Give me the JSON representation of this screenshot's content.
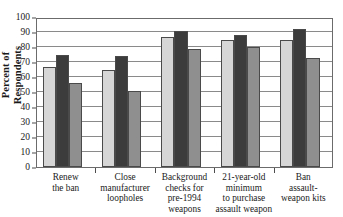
{
  "chart_data": {
    "type": "bar",
    "title": "",
    "xlabel": "",
    "ylabel": "Percent of Respondents",
    "ylabel_lines": [
      "Percent of",
      "Respondents"
    ],
    "ylim": [
      0,
      100
    ],
    "ytick_values": [
      0,
      10,
      20,
      30,
      40,
      50,
      60,
      70,
      80,
      90,
      100
    ],
    "ytick_labels": [
      "0",
      "10",
      "20",
      "30",
      "40",
      "50",
      "60",
      "70",
      "80",
      "90",
      "100"
    ],
    "grid": true,
    "legend": "none",
    "categories": [
      "Renew the ban",
      "Close manufacturer loopholes",
      "Background checks for pre-1994 weapons",
      "21-year-old minimum to purchase assault weapon",
      "Ban assault-weapon kits"
    ],
    "category_lines": [
      [
        "Renew",
        "the ban"
      ],
      [
        "Close",
        "manufacturer",
        "loopholes"
      ],
      [
        "Background",
        "checks for",
        "pre-1994",
        "weapons"
      ],
      [
        "21-year-old",
        "minimum",
        "to purchase",
        "assault weapon"
      ],
      [
        "Ban",
        "assault-",
        "weapon kits"
      ]
    ],
    "series": [
      {
        "name": "Series 1",
        "color": "#d6d6d6",
        "values": [
          67,
          65,
          87,
          85,
          85
        ]
      },
      {
        "name": "Series 2",
        "color": "#3c3c3c",
        "values": [
          75,
          74,
          91,
          88,
          92
        ]
      },
      {
        "name": "Series 3",
        "color": "#8f8f8f",
        "values": [
          56,
          51,
          79,
          80,
          73
        ]
      }
    ]
  },
  "colors": {
    "series_light": "#d6d6d6",
    "series_dark": "#3c3c3c",
    "series_medium": "#8f8f8f",
    "axis": "#6b6b6b",
    "grid": "#8a8a8a",
    "text": "#1a1a1a",
    "background": "#ffffff"
  }
}
